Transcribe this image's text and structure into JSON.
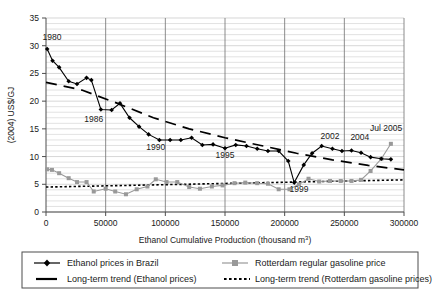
{
  "chart_data": {
    "type": "line",
    "title": "",
    "xlabel": "Ethanol Cumulative Production (thousand m3)",
    "xlabel_main": "Ethanol Cumulative Production (thousand m",
    "xlabel_sup": "3",
    "xlabel_tail": ")",
    "ylabel": "(2004) US$/GJ",
    "xlim": [
      0,
      300000
    ],
    "ylim": [
      0,
      35
    ],
    "xticks": [
      0,
      50000,
      100000,
      150000,
      200000,
      250000,
      300000
    ],
    "xtick_labels": [
      "0",
      "50000",
      "100000",
      "150000",
      "200000",
      "250000",
      "300000"
    ],
    "yticks": [
      0,
      5,
      10,
      15,
      20,
      25,
      30,
      35
    ],
    "ytick_labels": [
      "0",
      "5",
      "10",
      "15",
      "20",
      "25",
      "30",
      "35"
    ],
    "grid": "horizontal minor gridlines every 1 unit; vertical gridlines at major x ticks",
    "legend_position": "below-plot",
    "series": [
      {
        "name": "Ethanol prices in Brazil",
        "style": "solid-line-with-diamond-markers",
        "color": "#000000",
        "points": [
          [
            1000,
            29.4
          ],
          [
            5500,
            27.3
          ],
          [
            11000,
            26.1
          ],
          [
            19000,
            23.6
          ],
          [
            26000,
            23.1
          ],
          [
            34000,
            24.2
          ],
          [
            38000,
            23.8
          ],
          [
            46000,
            18.5
          ],
          [
            55000,
            18.4
          ],
          [
            62000,
            19.6
          ],
          [
            70000,
            17.0
          ],
          [
            78000,
            15.4
          ],
          [
            86000,
            14.0
          ],
          [
            95000,
            13.0
          ],
          [
            104000,
            13.0
          ],
          [
            113000,
            13.0
          ],
          [
            122000,
            13.4
          ],
          [
            131000,
            12.1
          ],
          [
            140000,
            12.2
          ],
          [
            150000,
            11.5
          ],
          [
            159000,
            12.1
          ],
          [
            168000,
            11.9
          ],
          [
            177000,
            11.4
          ],
          [
            186000,
            11.0
          ],
          [
            195000,
            11.0
          ],
          [
            203000,
            9.2
          ],
          [
            208000,
            5.3
          ],
          [
            216000,
            8.5
          ],
          [
            223000,
            10.6
          ],
          [
            231000,
            11.9
          ],
          [
            240000,
            11.4
          ],
          [
            248000,
            11.0
          ],
          [
            256000,
            11.1
          ],
          [
            264000,
            10.7
          ],
          [
            272000,
            9.9
          ],
          [
            281000,
            9.6
          ],
          [
            289000,
            9.5
          ]
        ]
      },
      {
        "name": "Rotterdam regular gasoline price",
        "style": "solid-line-with-square-markers",
        "color": "#999999",
        "points": [
          [
            1000,
            7.7
          ],
          [
            5000,
            7.6
          ],
          [
            11000,
            7.0
          ],
          [
            19000,
            6.1
          ],
          [
            26000,
            5.4
          ],
          [
            34000,
            5.4
          ],
          [
            40000,
            3.7
          ],
          [
            50000,
            4.2
          ],
          [
            58000,
            3.7
          ],
          [
            67000,
            3.2
          ],
          [
            76000,
            4.1
          ],
          [
            85000,
            4.6
          ],
          [
            92000,
            5.9
          ],
          [
            101000,
            5.4
          ],
          [
            110000,
            5.4
          ],
          [
            120000,
            4.5
          ],
          [
            129000,
            4.2
          ],
          [
            139000,
            4.6
          ],
          [
            148000,
            4.8
          ],
          [
            158000,
            5.2
          ],
          [
            167000,
            5.3
          ],
          [
            177000,
            5.2
          ],
          [
            186000,
            5.1
          ],
          [
            195000,
            4.1
          ],
          [
            204000,
            4.1
          ],
          [
            212000,
            5.0
          ],
          [
            220000,
            6.0
          ],
          [
            229000,
            5.5
          ],
          [
            238000,
            5.6
          ],
          [
            247000,
            5.6
          ],
          [
            256000,
            5.6
          ],
          [
            264000,
            5.8
          ],
          [
            272000,
            7.4
          ],
          [
            281000,
            9.6
          ],
          [
            289000,
            12.3
          ]
        ]
      },
      {
        "name": "Long-term trend (Ethanol prices)",
        "style": "dashed-line",
        "color": "#000000",
        "endpoints": [
          [
            0,
            23.4
          ],
          [
            300000,
            7.6
          ]
        ],
        "note": "curved declining trend, dashed segments"
      },
      {
        "name": "Long-term trend (Rotterdam gasoline prices)",
        "style": "dotted-line",
        "color": "#000000",
        "endpoints": [
          [
            0,
            4.5
          ],
          [
            300000,
            5.8
          ]
        ]
      }
    ],
    "annotations": [
      {
        "text": "1980",
        "x": 5000,
        "y": 31.0
      },
      {
        "text": "1986",
        "x": 40000,
        "y": 16.3
      },
      {
        "text": "1990",
        "x": 92000,
        "y": 11.2
      },
      {
        "text": "1995",
        "x": 150000,
        "y": 9.7
      },
      {
        "text": "1999",
        "x": 212000,
        "y": 3.6
      },
      {
        "text": "2002",
        "x": 238000,
        "y": 13.2
      },
      {
        "text": "2004",
        "x": 263000,
        "y": 13.0
      },
      {
        "text": "Jul 2005",
        "x": 285000,
        "y": 14.6
      }
    ]
  },
  "legend": {
    "items": [
      {
        "label": "Ethanol prices in Brazil",
        "marker": "line-diamond-marker"
      },
      {
        "label": "Rotterdam regular gasoline price",
        "marker": "line-square-marker"
      },
      {
        "label": "Long-term trend (Ethanol prices)",
        "marker": "dash-marker"
      },
      {
        "label": "Long-term trend (Rotterdam gasoline prices)",
        "marker": "dotted-marker"
      }
    ]
  }
}
